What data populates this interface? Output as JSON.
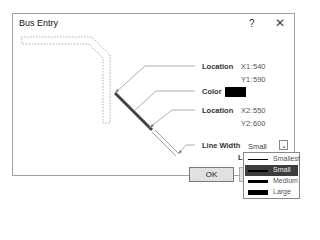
{
  "dialog": {
    "title": "Bus Entry",
    "help_label": "?",
    "close_label": "✕"
  },
  "fields": {
    "location1_label": "Location",
    "x1_label": "X1:",
    "x1_value": "540",
    "y1_label": "Y1:",
    "y1_value": "590",
    "color_label": "Color",
    "color_value": "#000000",
    "location2_label": "Location",
    "x2_label": "X2:",
    "x2_value": "550",
    "y2_label": "Y2:",
    "y2_value": "600",
    "line_width_label": "Line Width",
    "line_width_value": "Small",
    "partial_label": "L"
  },
  "dropdown": {
    "options": [
      {
        "label": "Smallest",
        "thickness": 1
      },
      {
        "label": "Small",
        "thickness": 2,
        "selected": true
      },
      {
        "label": "Medium",
        "thickness": 3
      },
      {
        "label": "Large",
        "thickness": 5
      }
    ]
  },
  "buttons": {
    "ok_label": "OK"
  },
  "colors": {
    "selected_item_bg": "#3d3d3d",
    "bus_entry_line": "#444444"
  }
}
